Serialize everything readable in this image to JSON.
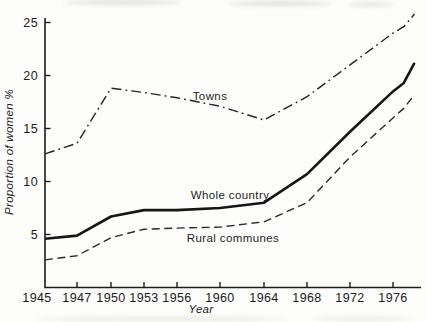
{
  "chart_data": {
    "type": "line",
    "title": "",
    "xlabel": "Year",
    "ylabel": "Proportion of women %",
    "x_ticks": [
      1945,
      1947,
      1950,
      1953,
      1956,
      1960,
      1964,
      1968,
      1972,
      1976
    ],
    "y_ticks": [
      5,
      10,
      15,
      20,
      25
    ],
    "ylim": [
      0,
      26
    ],
    "grid": "off",
    "legend": "inline labels next to lines",
    "series": [
      {
        "name": "Towns",
        "line_style": "dash-dot",
        "color": "#242424",
        "stroke_width": 1.4,
        "dash": "10,4,1.8,4",
        "x": [
          1945,
          1947,
          1950,
          1953,
          1956,
          1960,
          1964,
          1968,
          1972,
          1976,
          1977,
          1978
        ],
        "values": [
          12.6,
          13.6,
          18.8,
          18.4,
          17.9,
          17.1,
          15.8,
          18.0,
          21.0,
          24.0,
          24.6,
          25.8
        ]
      },
      {
        "name": "Whole country",
        "line_style": "solid",
        "color": "#161616",
        "stroke_width": 2.6,
        "dash": "",
        "x": [
          1945,
          1947,
          1950,
          1953,
          1956,
          1960,
          1964,
          1968,
          1972,
          1976,
          1977,
          1978
        ],
        "values": [
          4.6,
          4.9,
          6.7,
          7.3,
          7.3,
          7.5,
          8.0,
          10.7,
          14.7,
          18.5,
          19.3,
          21.2
        ]
      },
      {
        "name": "Rural communes",
        "line_style": "dashed",
        "color": "#2a2a2a",
        "stroke_width": 1.4,
        "dash": "8,4.5",
        "x": [
          1945,
          1947,
          1950,
          1953,
          1956,
          1960,
          1964,
          1968,
          1972,
          1976,
          1977,
          1978
        ],
        "values": [
          2.6,
          3.0,
          4.7,
          5.5,
          5.6,
          5.7,
          6.2,
          8.0,
          12.3,
          16.0,
          16.9,
          18.2
        ]
      }
    ],
    "layout": {
      "x_tick_px": [
        45,
        77,
        111,
        144,
        177,
        220,
        264,
        307,
        350,
        393
      ],
      "origin_x": 45,
      "origin_y": 287.5,
      "axis_top_y": 18,
      "axis_right_x": 421,
      "px_per_unit_y": 10.6,
      "tick_len": 5.5,
      "first_x_label_shift": -8
    }
  }
}
